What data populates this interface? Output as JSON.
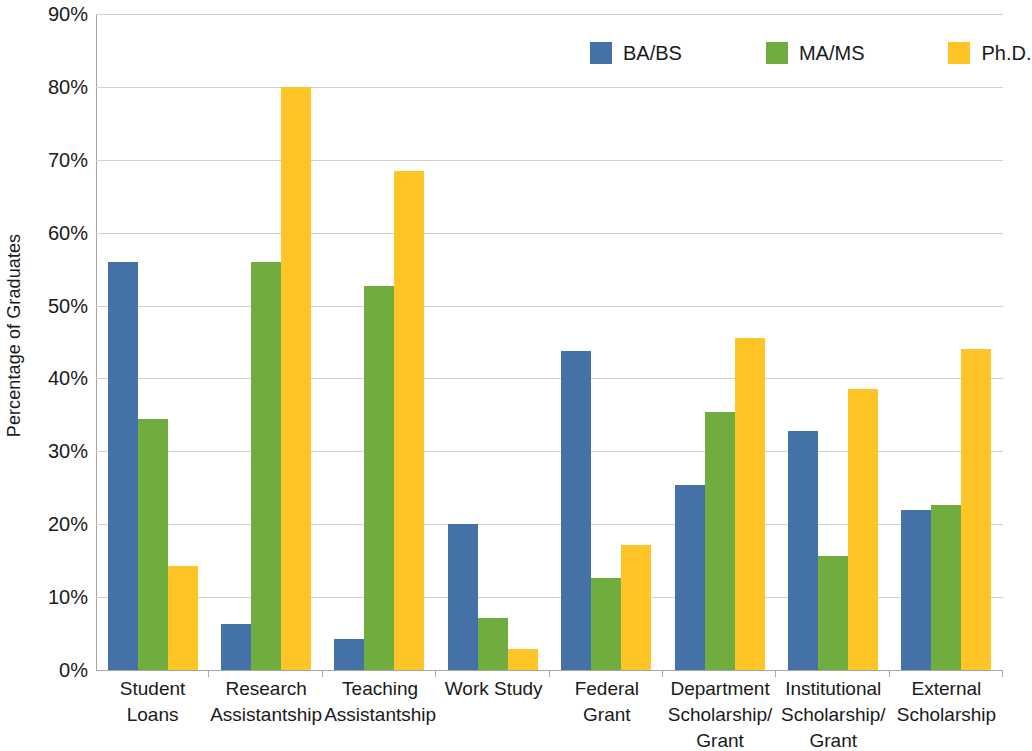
{
  "chart_data": {
    "type": "bar",
    "title": "",
    "xlabel": "",
    "ylabel": "Percentage of Graduates",
    "ylim": [
      0,
      90
    ],
    "ytick_labels": [
      "0%",
      "10%",
      "20%",
      "30%",
      "40%",
      "50%",
      "60%",
      "70%",
      "80%",
      "90%"
    ],
    "ytick_values": [
      0,
      10,
      20,
      30,
      40,
      50,
      60,
      70,
      80,
      90
    ],
    "grid": true,
    "legend_position": "top-right",
    "categories": [
      "Student Loans",
      "Research Assistantship",
      "Teaching Assistantship",
      "Work Study",
      "Federal Grant",
      "Department Scholarship/ Grant",
      "Institutional Scholarship/ Grant",
      "External Scholarship"
    ],
    "series": [
      {
        "name": "BA/BS",
        "color": "#4472A8",
        "values": [
          56.0,
          6.3,
          4.2,
          20.0,
          43.8,
          25.4,
          32.8,
          21.9
        ]
      },
      {
        "name": "MA/MS",
        "color": "#70AD3E",
        "values": [
          34.5,
          56.0,
          52.7,
          7.2,
          12.6,
          35.4,
          15.6,
          22.7
        ]
      },
      {
        "name": "Ph.D.",
        "color": "#FFC425",
        "values": [
          14.3,
          80.0,
          68.5,
          2.9,
          17.1,
          45.6,
          38.5,
          44.0
        ]
      }
    ]
  },
  "axis": {
    "y_title": "Percentage of Graduates"
  },
  "colors": {
    "gridline": "#d0d0d0",
    "axis": "#a6a6a6",
    "text": "#1a1a1a",
    "background": "#ffffff"
  }
}
